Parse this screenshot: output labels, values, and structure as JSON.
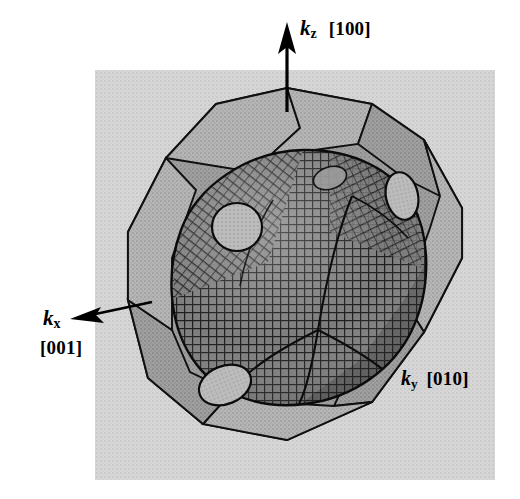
{
  "figure": {
    "kind": "fermi-surface-in-brillouin-zone",
    "background_color": "#ffffff",
    "panel_color": "#d2d2d2",
    "zone_face_light": "#b4b4b4",
    "zone_face_dark": "#9a9a9a",
    "surface_color": "#6e6e6e",
    "mesh_color": "#1a1a1a",
    "neck_color": "#b9b9b9",
    "line_color": "#000000"
  },
  "axes": {
    "kz": {
      "symbol": "k",
      "subscript": "z",
      "miller": "[100]",
      "arrow_direction": "up"
    },
    "kx": {
      "symbol": "k",
      "subscript": "x",
      "miller": "[001]",
      "arrow_direction": "up-left"
    },
    "ky": {
      "symbol": "k",
      "subscript": "y",
      "miller": "[010]",
      "arrow_direction": "none"
    }
  },
  "panel": {
    "x": 95,
    "y": 70,
    "width": 400,
    "height": 410
  },
  "zone_polygon": {
    "points": "287,88 372,104 424,140 462,208 462,258 424,332 372,402 287,440 203,424 148,378 128,300 128,232 166,158 216,104"
  },
  "necks": [
    {
      "name": "neck-upper-left",
      "cx": 237,
      "cy": 227,
      "rx": 25,
      "ry": 24,
      "rot": 0
    },
    {
      "name": "neck-upper-right",
      "cx": 402,
      "cy": 196,
      "rx": 16,
      "ry": 24,
      "rot": -12
    },
    {
      "name": "neck-lower-left",
      "cx": 225,
      "cy": 385,
      "rx": 27,
      "ry": 19,
      "rot": -22
    },
    {
      "name": "neck-top-back",
      "cx": 330,
      "cy": 178,
      "rx": 17,
      "ry": 11,
      "rot": -18
    }
  ]
}
